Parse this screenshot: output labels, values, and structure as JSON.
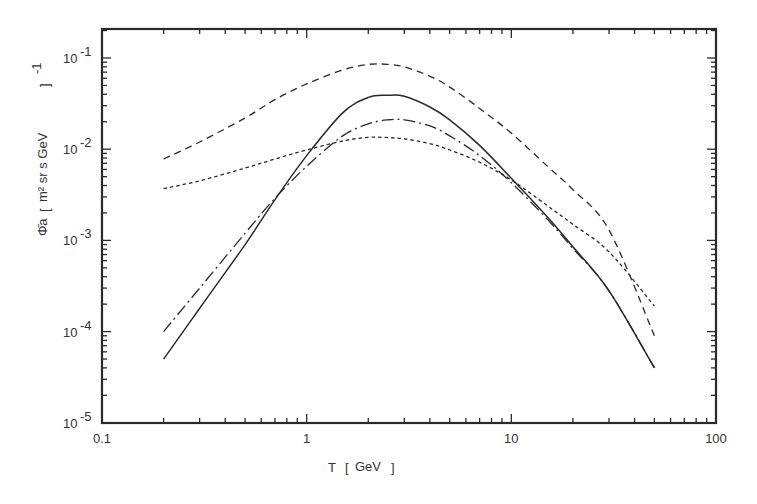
{
  "chart_data": {
    "type": "line",
    "title": "",
    "xlabel": "T [GeV]",
    "ylabel": "Φ̄a [m² sr s GeV]⁻¹",
    "xscale": "log",
    "yscale": "log",
    "xlim": [
      0.1,
      100
    ],
    "ylim": [
      1e-05,
      0.2
    ],
    "grid": false,
    "legend": "none",
    "x_tick_labels": [
      "0.1",
      "1",
      "10",
      "100"
    ],
    "y_tick_labels": [
      "10^-5",
      "10^-4",
      "10^-3",
      "10^-2",
      "10^-1"
    ],
    "x": [
      0.2,
      0.3,
      0.5,
      0.7,
      1.0,
      1.5,
      2.0,
      2.5,
      3.0,
      4.0,
      5.0,
      7.0,
      10.0,
      15.0,
      20.0,
      30.0,
      50.0
    ],
    "series": [
      {
        "name": "long-dashed",
        "style": "dashed",
        "values": [
          0.0078,
          0.012,
          0.022,
          0.035,
          0.052,
          0.074,
          0.085,
          0.085,
          0.08,
          0.063,
          0.048,
          0.028,
          0.015,
          0.0065,
          0.0036,
          0.0013,
          9e-05
        ]
      },
      {
        "name": "solid",
        "style": "solid",
        "values": [
          5e-05,
          0.00018,
          0.0009,
          0.0028,
          0.0085,
          0.025,
          0.037,
          0.039,
          0.038,
          0.029,
          0.021,
          0.011,
          0.0048,
          0.0018,
          0.00085,
          0.00028,
          4e-05
        ]
      },
      {
        "name": "dash-dot",
        "style": "dashdot",
        "values": [
          0.0001,
          0.0003,
          0.0012,
          0.0029,
          0.0065,
          0.014,
          0.019,
          0.021,
          0.021,
          0.018,
          0.014,
          0.0085,
          0.0043,
          0.0017,
          0.00082,
          0.00028,
          4e-05
        ]
      },
      {
        "name": "short-dashed",
        "style": "dotted",
        "values": [
          0.0037,
          0.0045,
          0.0062,
          0.0078,
          0.0098,
          0.0123,
          0.0135,
          0.0134,
          0.013,
          0.0115,
          0.0098,
          0.0072,
          0.0046,
          0.0024,
          0.0015,
          0.00075,
          0.00019
        ]
      }
    ]
  },
  "axes": {
    "x_title_symbol": "T",
    "x_title_unit": "GeV",
    "y_title_symbol": "Φ̄a",
    "y_title_unit": "m² sr s GeV",
    "y_title_exp": "-1",
    "x_ticks": [
      {
        "label": "0.1",
        "value": 0.1
      },
      {
        "label": "1",
        "value": 1
      },
      {
        "label": "10",
        "value": 10
      },
      {
        "label": "100",
        "value": 100
      }
    ],
    "y_ticks": [
      {
        "base": "10",
        "exp": "-1",
        "value": 0.1
      },
      {
        "base": "10",
        "exp": "-2",
        "value": 0.01
      },
      {
        "base": "10",
        "exp": "-3",
        "value": 0.001
      },
      {
        "base": "10",
        "exp": "-4",
        "value": 0.0001
      },
      {
        "base": "10",
        "exp": "-5",
        "value": 1e-05
      }
    ]
  },
  "colors": {
    "ink": "#2a2a2a",
    "background": "#ffffff"
  }
}
